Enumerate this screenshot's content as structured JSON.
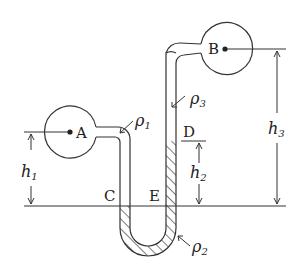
{
  "diagram": {
    "points": {
      "A": "A",
      "B": "B",
      "C": "C",
      "D": "D",
      "E": "E"
    },
    "densities": {
      "rho1": {
        "symbol": "ρ",
        "sub": "1"
      },
      "rho2": {
        "symbol": "ρ",
        "sub": "2"
      },
      "rho3": {
        "symbol": "ρ",
        "sub": "3"
      }
    },
    "heights": {
      "h1": {
        "symbol": "h",
        "sub": "1"
      },
      "h2": {
        "symbol": "h",
        "sub": "2"
      },
      "h3": {
        "symbol": "h",
        "sub": "3"
      }
    },
    "colors": {
      "stroke": "#333333",
      "background": "#ffffff"
    }
  }
}
